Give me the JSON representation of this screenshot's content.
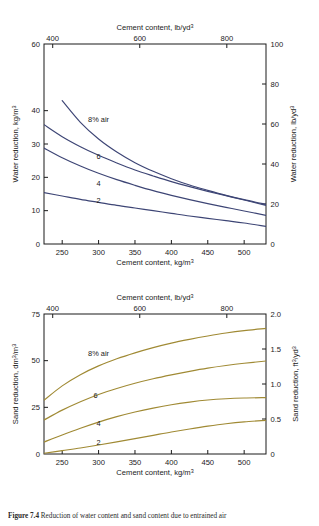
{
  "figure": {
    "caption_label": "Figure 7.4",
    "caption_text": "Reduction of water content and sand content due to entrained air"
  },
  "chart_data": [
    {
      "id": "water-reduction",
      "type": "line",
      "title": "",
      "xlabel": "Cement content, kg/m3",
      "xlabel_top": "Cement content, lb/yd3",
      "ylabel": "Water reduction, kg/m3",
      "ylabel_right": "Water reduction, lb/yd3",
      "xlim": [
        225,
        530
      ],
      "ylim": [
        0,
        60
      ],
      "ylim_right": [
        0,
        100
      ],
      "xlim_top": [
        380,
        890
      ],
      "grid": false,
      "legend_position": "inline-curve-labels",
      "xticks": [
        250,
        300,
        350,
        400,
        450,
        500
      ],
      "xticklabels": [
        "250",
        "300",
        "350",
        "400",
        "450",
        "500"
      ],
      "xticks_top": [
        400,
        600,
        800
      ],
      "xticklabels_top": [
        "400",
        "600",
        "800"
      ],
      "yticks": [
        0,
        10,
        20,
        30,
        40,
        60
      ],
      "yticklabels": [
        "0",
        "10",
        "20",
        "30",
        "40",
        "60"
      ],
      "yticks_right": [
        0,
        20,
        40,
        60,
        80,
        100
      ],
      "yticklabels_right": [
        "0",
        "20",
        "40",
        "60",
        "80",
        "100"
      ],
      "series": [
        {
          "name": "8% air",
          "label": "8% air",
          "color": "#3d4575",
          "x": [
            250,
            275,
            300,
            325,
            350,
            375,
            400,
            425,
            450,
            475,
            500,
            530
          ],
          "values": [
            43.0,
            36.5,
            31.5,
            27.6,
            24.4,
            21.8,
            19.6,
            17.7,
            16.1,
            14.6,
            13.3,
            11.9
          ]
        },
        {
          "name": "6",
          "label": "6",
          "color": "#3d4575",
          "x": [
            225,
            250,
            275,
            300,
            325,
            350,
            375,
            400,
            425,
            450,
            475,
            500,
            530
          ],
          "values": [
            35.8,
            32.2,
            29.2,
            26.6,
            24.3,
            22.2,
            20.4,
            18.7,
            17.2,
            15.8,
            14.5,
            13.2,
            11.6
          ]
        },
        {
          "name": "4",
          "label": "4",
          "color": "#3d4575",
          "x": [
            225,
            250,
            275,
            300,
            325,
            350,
            375,
            400,
            425,
            450,
            475,
            500,
            530
          ],
          "values": [
            28.8,
            25.9,
            23.4,
            21.2,
            19.3,
            17.6,
            16.0,
            14.6,
            13.3,
            12.1,
            11.0,
            9.9,
            8.6
          ]
        },
        {
          "name": "2",
          "label": "2",
          "color": "#3d4575",
          "x": [
            225,
            250,
            275,
            300,
            325,
            350,
            375,
            400,
            425,
            450,
            475,
            500,
            530
          ],
          "values": [
            15.4,
            14.4,
            13.4,
            12.5,
            11.6,
            10.8,
            10.0,
            9.2,
            8.4,
            7.7,
            7.0,
            6.3,
            5.3
          ]
        }
      ]
    },
    {
      "id": "sand-reduction",
      "type": "line",
      "title": "",
      "xlabel": "Cement content, kg/m3",
      "xlabel_top": "Cement content, lb/yd3",
      "ylabel": "Sand reduction, dm3/m3",
      "ylabel_right": "Sand reduction, ft3/yd3",
      "xlim": [
        225,
        530
      ],
      "ylim": [
        0,
        75
      ],
      "ylim_right": [
        0,
        2.0
      ],
      "xlim_top": [
        380,
        890
      ],
      "grid": false,
      "legend_position": "inline-curve-labels",
      "xticks": [
        250,
        300,
        350,
        400,
        450,
        500
      ],
      "xticklabels": [
        "250",
        "300",
        "350",
        "400",
        "450",
        "500"
      ],
      "xticks_top": [
        400,
        600,
        800
      ],
      "xticklabels_top": [
        "400",
        "600",
        "800"
      ],
      "yticks": [
        0,
        25,
        50,
        75
      ],
      "yticklabels": [
        "0",
        "25",
        "50",
        "75"
      ],
      "yticks_right": [
        0,
        0.5,
        1.0,
        1.5,
        2.0
      ],
      "yticklabels_right": [
        "0",
        "0.5",
        "1.0",
        "1.5",
        "2.0"
      ],
      "series": [
        {
          "name": "8% air",
          "label": "8% air",
          "color": "#a08a34",
          "x": [
            225,
            250,
            275,
            300,
            325,
            350,
            375,
            400,
            425,
            450,
            475,
            500,
            530
          ],
          "values": [
            28.8,
            36.5,
            42.5,
            47.2,
            51.0,
            54.2,
            57.0,
            59.4,
            61.4,
            63.2,
            64.8,
            66.1,
            67.3
          ]
        },
        {
          "name": "6",
          "label": "6",
          "color": "#a08a34",
          "x": [
            225,
            250,
            275,
            300,
            325,
            350,
            375,
            400,
            425,
            450,
            475,
            500,
            530
          ],
          "values": [
            18.2,
            23.5,
            28.0,
            31.9,
            35.1,
            37.9,
            40.3,
            42.4,
            44.3,
            46.0,
            47.4,
            48.6,
            49.8
          ]
        },
        {
          "name": "4",
          "label": "4",
          "color": "#a08a34",
          "x": [
            225,
            250,
            275,
            300,
            325,
            350,
            375,
            400,
            425,
            450,
            475,
            500,
            530
          ],
          "values": [
            6.4,
            10.2,
            13.8,
            17.1,
            20.0,
            22.5,
            24.6,
            26.4,
            27.8,
            28.9,
            29.6,
            30.0,
            30.2
          ]
        },
        {
          "name": "2",
          "label": "2",
          "color": "#a08a34",
          "x": [
            225,
            250,
            275,
            300,
            325,
            350,
            375,
            400,
            425,
            450,
            475,
            500,
            530
          ],
          "values": [
            0.4,
            1.8,
            3.2,
            4.8,
            6.5,
            8.2,
            10.0,
            11.8,
            13.4,
            14.9,
            16.2,
            17.2,
            18.0
          ]
        }
      ]
    }
  ],
  "axes_text": {
    "cement_content": "Cement content, ",
    "unit_kg": "kg/m",
    "unit_lb_yd": "lb/yd",
    "water_reduction": "Water reduction, ",
    "sand_reduction": "Sand reduction, ",
    "unit_dm3_m3_a": "dm",
    "unit_dm3_m3_b": "/m",
    "unit_ft3_yd3_a": "ft",
    "unit_ft3_yd3_b": "/yd",
    "sup3": "3"
  }
}
